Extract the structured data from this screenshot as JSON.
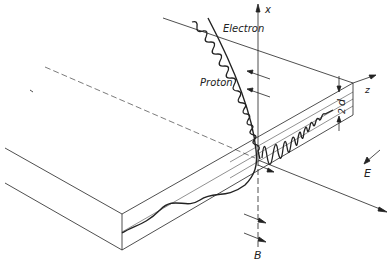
{
  "diagram": {
    "type": "physics-schematic",
    "labels": {
      "electron": "Electron",
      "proton": "Proton",
      "x_axis": "x",
      "z_axis": "z",
      "thickness": "2d",
      "thickness_d": "d",
      "thickness_2": "2",
      "field_E": "E",
      "field_B": "B"
    },
    "colors": {
      "line": "#222222",
      "background": "#ffffff"
    }
  }
}
